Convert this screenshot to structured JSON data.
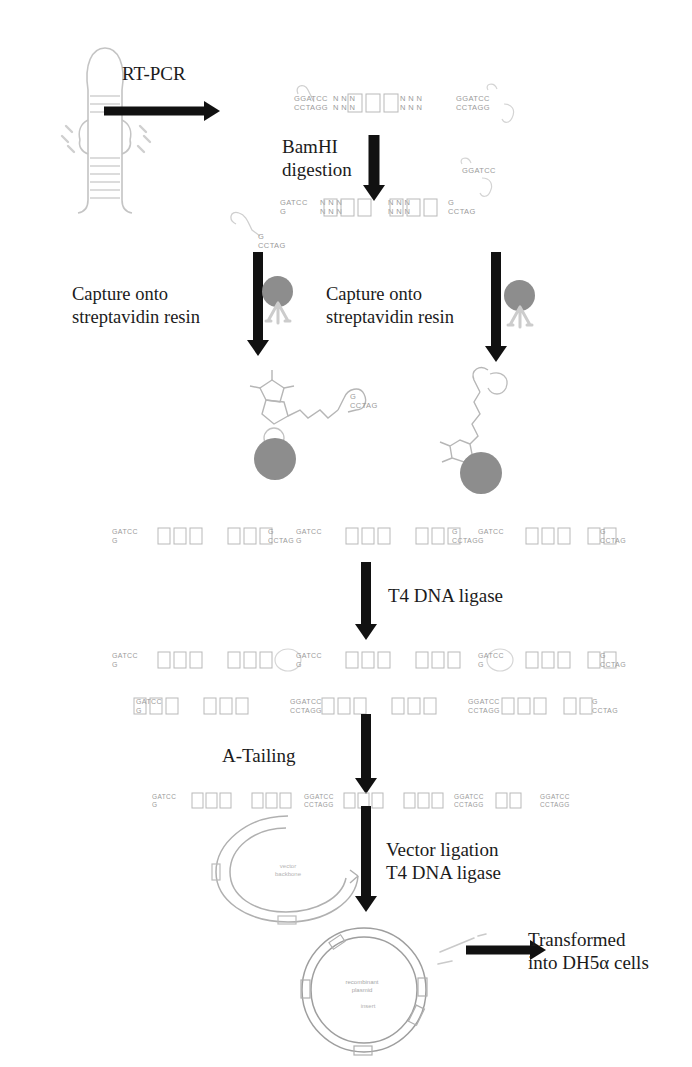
{
  "figure": {
    "background_color": "#ffffff",
    "ink_color": "#1b1b1b",
    "bead_color": "#8d8d8d",
    "faint_color": "#9a9a9a"
  },
  "steps": {
    "rt_pcr": "RT-PCR",
    "bamhi_digestion": "BamHI\ndigestion",
    "capture_left": "Capture onto\nstreptavidin resin",
    "capture_right": "Capture onto\nstreptavidin resin",
    "t4_ligase": "T4 DNA ligase",
    "a_tailing": "A-Tailing",
    "vector_ligation": "Vector ligation\nT4 DNA ligase",
    "transformed": "Transformed\ninto DH5α cells"
  },
  "sequences": {
    "bamhi_top": "GGATCC",
    "bamhi_bottom": "CCTAGG",
    "cut_top": "GATCC",
    "cut_bottom": "G",
    "overhang_top": "G",
    "overhang_bottom": "CCTAG",
    "n_base": "N",
    "five_prime": "5'",
    "three_prime": "3'"
  },
  "molecules": {
    "hairpin_label": "rna-hairpin",
    "biotin_label": "biotin",
    "streptavidin_label": "streptavidin-resin-bead",
    "plasmid_open_label": "linearized-vector",
    "plasmid_closed_label": "recombinant-plasmid"
  },
  "dna_rows": {
    "digested_top": [
      {
        "top": "GGATCC",
        "bot": "CCTAGG"
      },
      {
        "top": "N N N",
        "bot": "N N N"
      },
      {
        "top": "N N N",
        "bot": "N N N"
      },
      {
        "top": "GGATCC",
        "bot": "CCTAGG"
      }
    ],
    "digested_bottom": [
      {
        "top": "GATCC",
        "bot": "G"
      },
      {
        "top": "N N N",
        "bot": "N N N"
      },
      {
        "top": "N N N",
        "bot": "N N N"
      },
      {
        "top": "G",
        "bot": "CCTAG"
      }
    ],
    "pooled_fragments": [
      {
        "top": "GATCC",
        "bot": "G"
      },
      {
        "top": "N N N",
        "bot": "N N N"
      },
      {
        "top": "N N N",
        "bot": "N N N"
      },
      {
        "top": "G",
        "bot": "CCTAG"
      }
    ],
    "ligated": [
      {
        "top": "GATCC",
        "bot": "G"
      },
      {
        "top": "N N N",
        "bot": "N N N"
      },
      {
        "top": "N N N",
        "bot": "N N N"
      },
      {
        "top": "GGATCC",
        "bot": "CCTAGG"
      }
    ],
    "a_tailed": [
      {
        "top": "GATCC",
        "bot": "G"
      },
      {
        "top": "N N N",
        "bot": "N N N"
      },
      {
        "top": "N N N",
        "bot": "N N N"
      },
      {
        "top": "GGATCC",
        "bot": "CCTAGG"
      }
    ]
  }
}
